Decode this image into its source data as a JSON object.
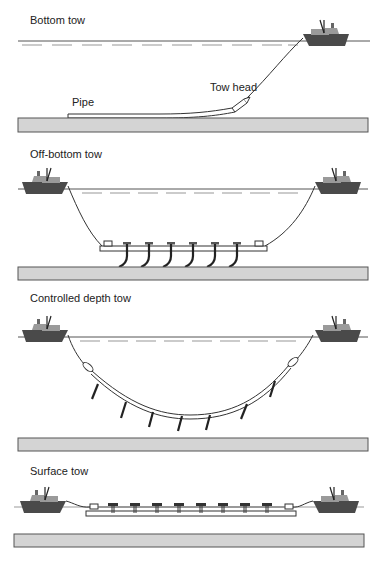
{
  "diagram": {
    "panels": [
      {
        "id": "bottom-tow",
        "title": "Bottom tow",
        "labels": {
          "pipe": "Pipe",
          "tow_head": "Tow head"
        }
      },
      {
        "id": "off-bottom-tow",
        "title": "Off-bottom tow"
      },
      {
        "id": "controlled-depth-tow",
        "title": "Controlled depth tow"
      },
      {
        "id": "surface-tow",
        "title": "Surface tow"
      }
    ],
    "colors": {
      "seabed_fill": "#d4d4d4",
      "vessel_hull": "#4a4a4a",
      "vessel_superstructure": "#9a9a9a",
      "line": "#333333",
      "water_dash": "#a8a8a8"
    }
  }
}
